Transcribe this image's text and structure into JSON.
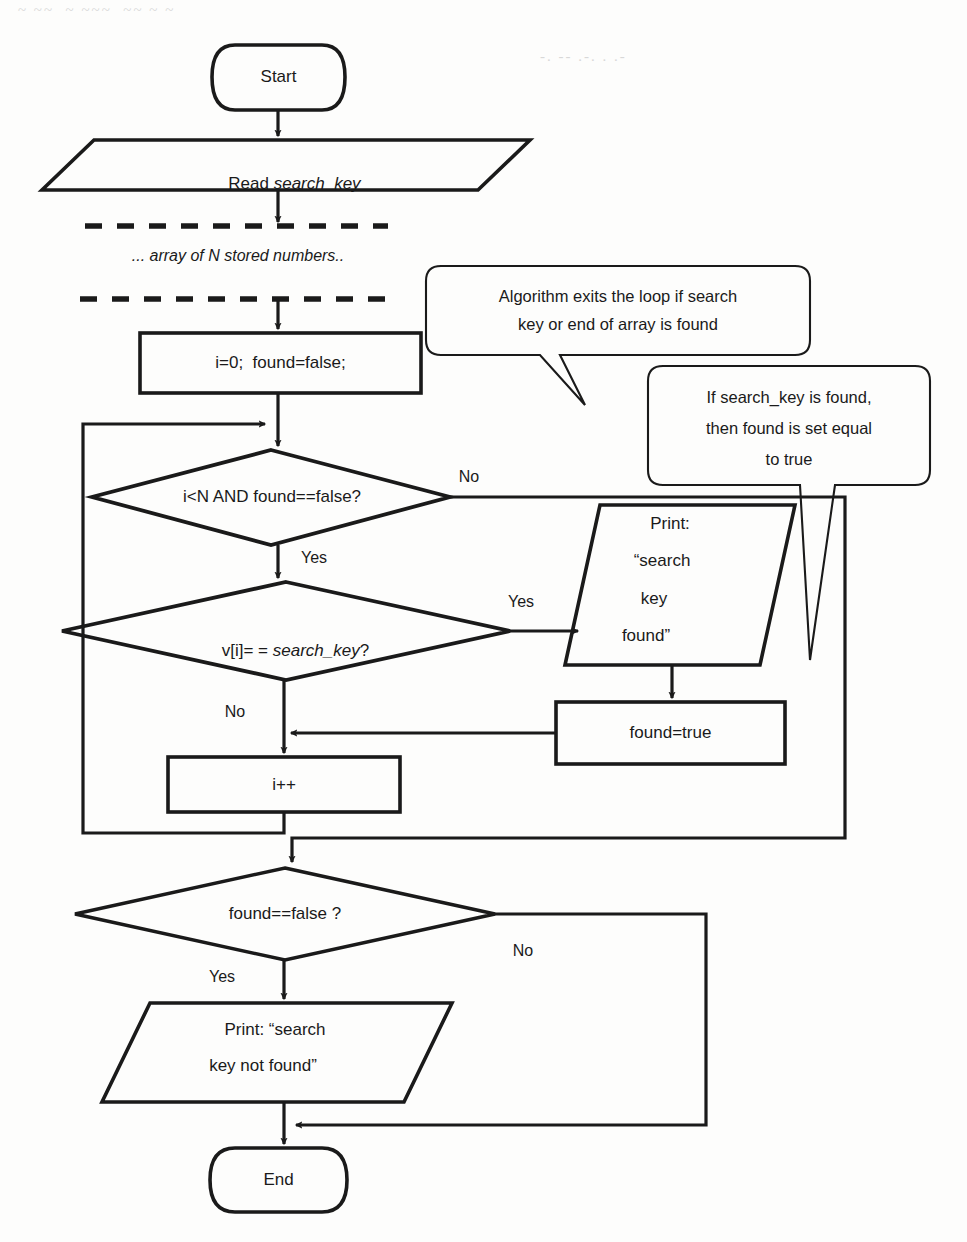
{
  "diagram": {
    "colors": {
      "stroke": "#1a1a1a",
      "background": "#fdfdfc",
      "text": "#1a1a1a"
    },
    "nodes": {
      "start": {
        "label": "Start",
        "shape": "terminator"
      },
      "read_input": {
        "label": "Read ",
        "label_italic": "search_key",
        "shape": "parallelogram-io"
      },
      "array_note": {
        "label": "... array of N stored numbers..",
        "shape": "annotation"
      },
      "init": {
        "label": "i=0;  found=false;",
        "shape": "process"
      },
      "loop_condition": {
        "label": "i<N AND found==false?",
        "shape": "decision"
      },
      "compare": {
        "label_prefix": "v[i]= = ",
        "label_italic": "search_key",
        "label_suffix": "?",
        "shape": "decision"
      },
      "print_found": {
        "lines": [
          "Print:",
          "“search",
          "key",
          "found”"
        ],
        "shape": "parallelogram-io"
      },
      "set_found": {
        "label": "found=true",
        "shape": "process"
      },
      "increment": {
        "label": "i++",
        "shape": "process"
      },
      "check_found": {
        "label": "found==false ?",
        "shape": "decision"
      },
      "print_not_found": {
        "lines": [
          "Print: “search",
          "key not found”"
        ],
        "shape": "parallelogram-io"
      },
      "end": {
        "label": "End",
        "shape": "terminator"
      }
    },
    "edge_labels": {
      "loop_no": "No",
      "loop_yes": "Yes",
      "compare_yes": "Yes",
      "compare_no": "No",
      "check_yes": "Yes",
      "check_no": "No"
    },
    "callouts": [
      {
        "id": "callout-loop-exit",
        "lines": [
          "Algorithm exits the loop if search",
          "key or end of array is found"
        ]
      },
      {
        "id": "callout-set-true",
        "lines": [
          "If search_key is found,",
          "then found is set equal",
          "to true"
        ]
      }
    ]
  },
  "artifacts": {
    "top_bleed": "~ ~~  ~ ~~~  ~~ ~ ~",
    "top_right_bleed": "-. -- .-. . .-"
  }
}
